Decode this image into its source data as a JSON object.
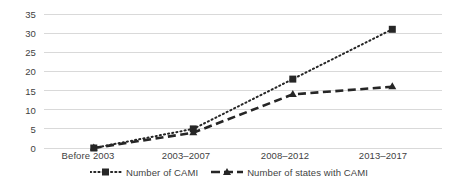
{
  "chart_data": {
    "type": "line",
    "title": "",
    "subtitle": "",
    "xlabel": "",
    "ylabel": "",
    "ylim": [
      0,
      35
    ],
    "yticks": [
      0,
      5,
      10,
      15,
      20,
      25,
      30,
      35
    ],
    "grid": true,
    "legend_position": "bottom",
    "categories": [
      "Before 2003",
      "2003–2007",
      "2008–2012",
      "2013–2017"
    ],
    "series": [
      {
        "name": "Number of CAMI",
        "values": [
          0,
          5,
          18,
          31
        ],
        "marker": "square",
        "linestyle": "dotted",
        "color": "#262626"
      },
      {
        "name": "Number of states with CAMI",
        "values": [
          0,
          4,
          14,
          16
        ],
        "marker": "triangle",
        "linestyle": "dashed",
        "color": "#262626"
      }
    ]
  },
  "axis": {
    "y_tick_labels": [
      "35",
      "30",
      "25",
      "20",
      "15",
      "10",
      "5",
      "0"
    ],
    "x_tick_labels": [
      "Before 2003",
      "2003–2007",
      "2008–2012",
      "2013–2017"
    ]
  },
  "legend": {
    "entries": [
      {
        "label": "Number of CAMI"
      },
      {
        "label": "Number of states with CAMI"
      }
    ]
  },
  "colors": {
    "gridline": "#d9d9d9",
    "series": "#262626",
    "text": "#3f3f3f",
    "background": "#ffffff"
  }
}
